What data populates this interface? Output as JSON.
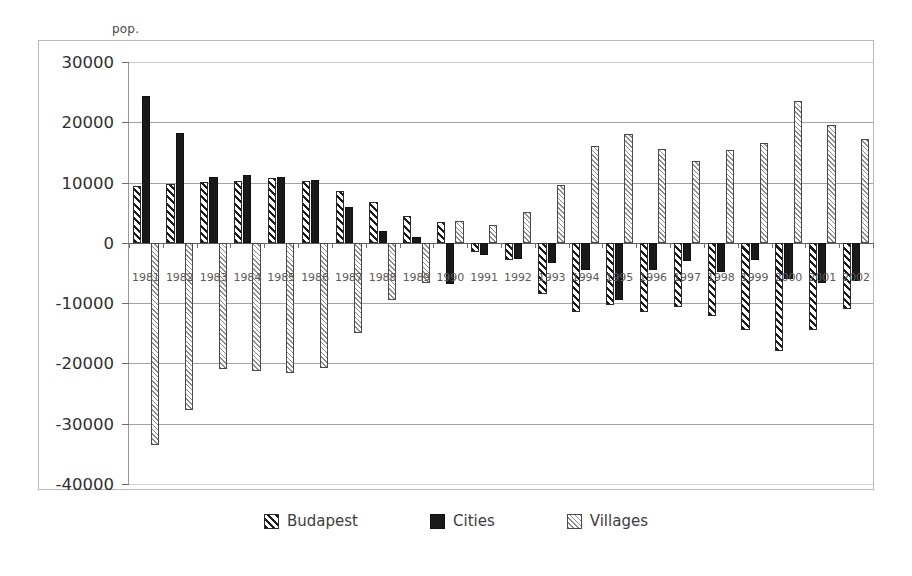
{
  "chart_data": {
    "type": "bar",
    "title": "",
    "subtitle": "",
    "xlabel": "",
    "ylabel": "pop.",
    "ylim": [
      -40000,
      30000
    ],
    "ytick_step": 10000,
    "yticks": [
      30000,
      20000,
      10000,
      0,
      -10000,
      -20000,
      -30000,
      -40000
    ],
    "ytick_labels": [
      "30000",
      "20000",
      "10000",
      "0",
      "-10000",
      "-20000",
      "-30000",
      "-40000"
    ],
    "grid": true,
    "legend_position": "bottom",
    "categories": [
      "1981",
      "1982",
      "1983",
      "1984",
      "1985",
      "1986",
      "1987",
      "1988",
      "1989",
      "1990",
      "1991",
      "1992",
      "1993",
      "1994",
      "1995",
      "1996",
      "1997",
      "1998",
      "1999",
      "2000",
      "2001",
      "2002"
    ],
    "series": [
      {
        "name": "Budapest",
        "pattern": "diagonal-hatch",
        "color": "#1c1c1c",
        "values": [
          9500,
          9800,
          10100,
          10200,
          10700,
          10200,
          8600,
          6800,
          4500,
          3400,
          -1600,
          -2900,
          -8500,
          -11500,
          -10300,
          -11400,
          -10700,
          -12200,
          -14500,
          -18000,
          -14500,
          -11000
        ]
      },
      {
        "name": "Cities",
        "pattern": "solid",
        "color": "#1a1a1a",
        "values": [
          24300,
          18200,
          11000,
          11200,
          10900,
          10500,
          5900,
          2000,
          900,
          -6800,
          -2000,
          -2700,
          -3300,
          -4500,
          -9500,
          -4500,
          -3000,
          -4800,
          -2800,
          -6000,
          -6600,
          -6400
        ]
      },
      {
        "name": "Villages",
        "pattern": "fine-hatch",
        "color": "#8a8a8a",
        "values": [
          -33500,
          -27700,
          -20900,
          -21200,
          -21600,
          -20800,
          -15000,
          -9400,
          -6700,
          3700,
          3000,
          5200,
          9600,
          16000,
          18000,
          15500,
          13500,
          15400,
          16600,
          23500,
          19500,
          17300
        ]
      }
    ]
  },
  "legend": {
    "items": [
      {
        "label": "Budapest",
        "key": "budapest"
      },
      {
        "label": "Cities",
        "key": "cities"
      },
      {
        "label": "Villages",
        "key": "villages"
      }
    ]
  }
}
